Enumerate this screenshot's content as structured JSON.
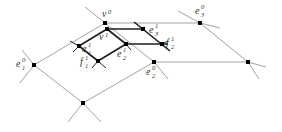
{
  "diagram": {
    "labels": {
      "v0": {
        "base": "v",
        "sup": "0",
        "sub": ""
      },
      "v1": {
        "base": "v",
        "sup": "1",
        "sub": ""
      },
      "e11": {
        "base": "e",
        "sup": "1",
        "sub": "1"
      },
      "e21": {
        "base": "e",
        "sup": "1",
        "sub": "2"
      },
      "e31": {
        "base": "e",
        "sup": "1",
        "sub": "3"
      },
      "f11": {
        "base": "f",
        "sup": "1",
        "sub": "1"
      },
      "f21": {
        "base": "f",
        "sup": "1",
        "sub": "2"
      },
      "e10": {
        "base": "e",
        "sup": "0",
        "sub": "1"
      },
      "e20": {
        "base": "e",
        "sup": "0",
        "sub": "2"
      },
      "e30": {
        "base": "e",
        "sup": "0",
        "sub": "3"
      }
    },
    "colors": {
      "coarse_edge": "#8a8a8a",
      "fine_edge": "#1e1e1e",
      "vertex": "#000000"
    }
  }
}
